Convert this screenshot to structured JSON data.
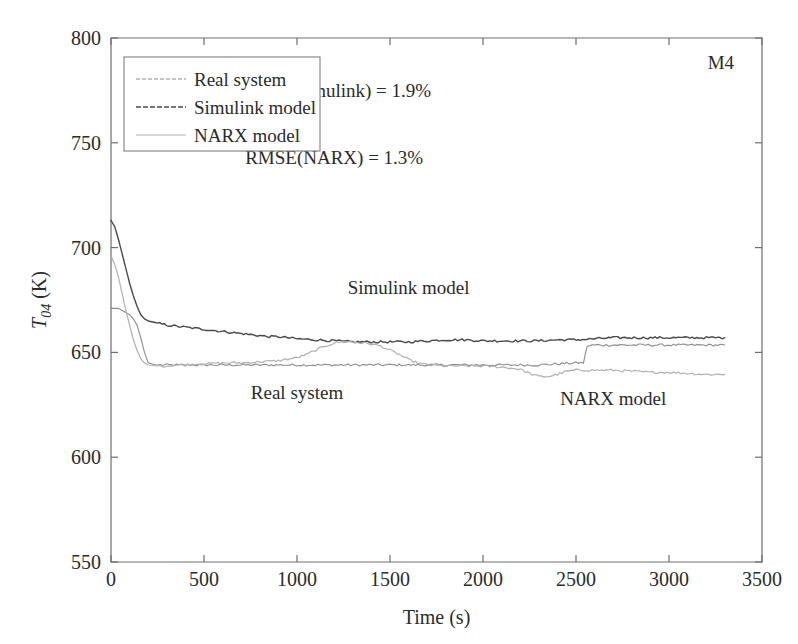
{
  "figure": {
    "corner_label": "M4",
    "background": "#ffffff"
  },
  "annotations": {
    "rmse_simulink": "RMSE(Simulink) = 1.9%",
    "rmse_narx": "RMSE(NARX) = 1.3%",
    "curve_label_simulink": "Simulink model",
    "curve_label_real": "Real system",
    "curve_label_narx": "NARX model"
  },
  "axis": {
    "y_title_main": "T",
    "y_title_sub": "04",
    "y_title_unit": " (K)",
    "x_title": "Time (s)",
    "x_ticks": [
      "0",
      "500",
      "1000",
      "1500",
      "2000",
      "2500",
      "3000",
      "3500"
    ],
    "y_ticks": [
      "550",
      "600",
      "650",
      "700",
      "750",
      "800"
    ]
  },
  "legend": {
    "items": [
      {
        "label": "Real system",
        "color": "#8c8c8c",
        "dash": "4,2",
        "width": 1.1
      },
      {
        "label": "Simulink model",
        "color": "#4a4a4a",
        "dash": "5,2",
        "width": 1.4
      },
      {
        "label": "NARX model",
        "color": "#b0b0b0",
        "dash": "none",
        "width": 1.2
      }
    ]
  },
  "chart_data": {
    "type": "line",
    "title": "",
    "subtitle": "",
    "xlabel": "Time (s)",
    "ylabel": "T_04 (K)",
    "xlim": [
      0,
      3500
    ],
    "ylim": [
      550,
      800
    ],
    "xticks": [
      0,
      500,
      1000,
      1500,
      2000,
      2500,
      3000,
      3500
    ],
    "yticks": [
      550,
      600,
      650,
      700,
      750,
      800
    ],
    "grid": false,
    "legend_position": "upper-left",
    "annotations": [
      {
        "text": "RMSE(Simulink) = 1.9%",
        "x": 1200,
        "y": 772
      },
      {
        "text": "RMSE(NARX) = 1.3%",
        "x": 1200,
        "y": 740
      },
      {
        "text": "Simulink model",
        "x": 1600,
        "y": 678
      },
      {
        "text": "Real system",
        "x": 1000,
        "y": 628
      },
      {
        "text": "NARX model",
        "x": 2700,
        "y": 625
      },
      {
        "text": "M4",
        "x": 3350,
        "y": 785
      }
    ],
    "series": [
      {
        "name": "Real system",
        "color": "#8c8c8c",
        "x": [
          0,
          20,
          40,
          60,
          80,
          100,
          120,
          140,
          160,
          180,
          200,
          240,
          300,
          400,
          500,
          600,
          700,
          800,
          900,
          1000,
          1100,
          1200,
          1300,
          1400,
          1500,
          1600,
          1700,
          1800,
          1900,
          2000,
          2100,
          2200,
          2300,
          2400,
          2500,
          2540,
          2560,
          2600,
          2700,
          2800,
          2900,
          3000,
          3100,
          3200,
          3300
        ],
        "y": [
          671,
          671,
          671,
          670,
          669,
          668,
          666,
          663,
          657,
          650,
          645,
          644,
          644,
          644,
          644,
          644,
          644,
          644,
          644,
          644,
          644,
          644,
          644,
          644,
          644,
          644,
          644,
          644,
          644,
          644,
          644,
          644,
          644,
          644.5,
          645,
          645,
          653,
          653.5,
          653.5,
          653.5,
          653.5,
          653.5,
          653.5,
          653.5,
          653.5
        ]
      },
      {
        "name": "Simulink model",
        "color": "#4a4a4a",
        "x": [
          0,
          20,
          40,
          60,
          80,
          100,
          120,
          140,
          160,
          180,
          200,
          250,
          300,
          350,
          400,
          450,
          500,
          550,
          600,
          650,
          700,
          750,
          800,
          850,
          900,
          950,
          1000,
          1100,
          1200,
          1300,
          1400,
          1500,
          1600,
          1700,
          1800,
          1900,
          2000,
          2100,
          2200,
          2300,
          2400,
          2500,
          2600,
          2700,
          2800,
          2900,
          3000,
          3100,
          3200,
          3300
        ],
        "y": [
          713,
          710,
          704,
          697,
          690,
          683,
          677,
          672,
          668,
          666,
          665,
          664,
          663,
          662.5,
          662,
          661.5,
          661,
          660.5,
          660,
          659.5,
          659,
          658.5,
          658,
          657.5,
          657.5,
          657,
          656.5,
          656,
          655.5,
          655,
          655,
          655,
          655,
          655.5,
          656,
          656,
          655.5,
          655.5,
          655.5,
          655.5,
          656,
          656,
          656.5,
          657,
          657,
          657,
          657,
          657,
          657,
          657
        ]
      },
      {
        "name": "NARX model",
        "color": "#b0b0b0",
        "x": [
          0,
          20,
          40,
          60,
          80,
          100,
          120,
          140,
          160,
          180,
          200,
          250,
          300,
          350,
          400,
          450,
          500,
          600,
          700,
          800,
          900,
          1000,
          1050,
          1100,
          1150,
          1200,
          1250,
          1300,
          1350,
          1400,
          1450,
          1500,
          1550,
          1600,
          1650,
          1700,
          1800,
          1900,
          2000,
          2100,
          2200,
          2250,
          2300,
          2350,
          2400,
          2450,
          2500,
          2550,
          2600,
          2700,
          2800,
          2900,
          3000,
          3100,
          3200,
          3300
        ],
        "y": [
          696,
          692,
          686,
          678,
          670,
          663,
          656,
          651,
          647,
          645,
          644,
          643.5,
          643.5,
          644,
          644,
          644.5,
          644.5,
          645,
          645,
          645.5,
          646,
          647.5,
          649,
          651,
          653,
          654.5,
          655,
          655,
          654.5,
          654,
          653,
          651,
          649,
          646.5,
          645,
          644,
          643.5,
          643.5,
          643.5,
          643,
          642,
          640,
          638.5,
          638.5,
          639.5,
          641,
          641.5,
          641.5,
          641.5,
          641.5,
          641,
          640.5,
          640.5,
          640,
          639.5,
          639.5
        ]
      }
    ]
  }
}
